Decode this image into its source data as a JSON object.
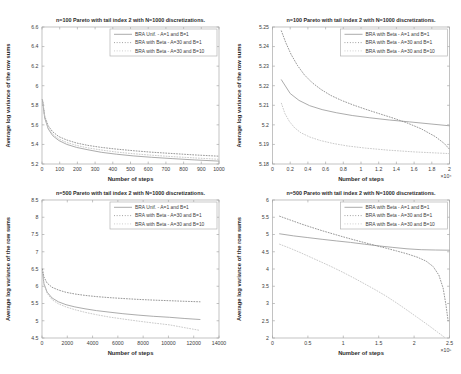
{
  "style": {
    "background": "#ffffff",
    "axis_color": "#a8a8a8",
    "text_color": "#3d3d3d",
    "title_color": "#2b2b2b",
    "legend_border_color": "#b4b4b4",
    "legend_background": "#ffffff"
  },
  "chart_data": [
    {
      "type": "line",
      "title": "n=100 Pareto with tail index 2 with N=1000 discretizations.",
      "xlabel": "Number of steps",
      "ylabel": "Average log variance of the row sums",
      "xlim": [
        0,
        1000
      ],
      "ylim": [
        5.2,
        6.6
      ],
      "xticks": [
        0,
        100,
        200,
        300,
        400,
        500,
        600,
        700,
        800,
        900,
        1000
      ],
      "xtick_labels": [
        "0",
        "100",
        "200",
        "300",
        "400",
        "500",
        "600",
        "700",
        "800",
        "900",
        "1000"
      ],
      "yticks": [
        5.2,
        5.4,
        5.6,
        5.8,
        6,
        6.2,
        6.4,
        6.6
      ],
      "ytick_labels": [
        "5.2",
        "5.4",
        "5.6",
        "5.8",
        "6",
        "6.2",
        "6.4",
        "6.6"
      ],
      "x_exponent_label": "",
      "legend_position": "top-right",
      "grid": false,
      "series": [
        {
          "name": "BRA Unif. - A=1 and B=1",
          "style": "solid",
          "color": "#a3a3a3",
          "x": [
            2,
            15,
            35,
            60,
            95,
            140,
            195,
            260,
            335,
            420,
            515,
            620,
            735,
            860,
            1000
          ],
          "y": [
            5.86,
            5.67,
            5.56,
            5.49,
            5.44,
            5.4,
            5.37,
            5.345,
            5.32,
            5.3,
            5.283,
            5.268,
            5.255,
            5.242,
            5.23
          ]
        },
        {
          "name": "BRA with Beta - A=30 and B=1",
          "style": "dotted",
          "color": "#8c8c8c",
          "x": [
            2,
            15,
            35,
            60,
            95,
            140,
            195,
            260,
            335,
            420,
            515,
            620,
            735,
            860,
            1000
          ],
          "y": [
            5.86,
            5.69,
            5.59,
            5.53,
            5.48,
            5.445,
            5.415,
            5.39,
            5.37,
            5.352,
            5.336,
            5.321,
            5.307,
            5.293,
            5.28
          ]
        },
        {
          "name": "BRA with Beta - A=30 and B=10",
          "style": "dotted",
          "color": "#c4c4c4",
          "x": [
            2,
            15,
            35,
            60,
            95,
            140,
            195,
            260,
            335,
            420,
            515,
            620,
            735,
            860,
            1000
          ],
          "y": [
            5.86,
            5.68,
            5.57,
            5.505,
            5.455,
            5.42,
            5.39,
            5.365,
            5.343,
            5.323,
            5.305,
            5.29,
            5.276,
            5.262,
            5.248
          ]
        }
      ]
    },
    {
      "type": "line",
      "title": "n=100 Pareto with tail index 2 with N=1000 discretizations.",
      "xlabel": "Number of steps",
      "ylabel": "Average log variance of the row sums",
      "xlim": [
        0,
        2
      ],
      "ylim": [
        5.18,
        5.25
      ],
      "xticks": [
        0,
        0.2,
        0.4,
        0.6,
        0.8,
        1,
        1.2,
        1.4,
        1.6,
        1.8,
        2
      ],
      "xtick_labels": [
        "0",
        "0.2",
        "0.4",
        "0.6",
        "0.8",
        "1",
        "1.2",
        "1.4",
        "1.6",
        "1.8",
        "2"
      ],
      "yticks": [
        5.18,
        5.19,
        5.2,
        5.21,
        5.22,
        5.23,
        5.24,
        5.25
      ],
      "ytick_labels": [
        "5.18",
        "5.19",
        "5.2",
        "5.21",
        "5.22",
        "5.23",
        "5.24",
        "5.25"
      ],
      "x_exponent_label": "×10⁴",
      "legend_position": "top-right",
      "grid": false,
      "series": [
        {
          "name": "BRA with Beta - A=1 and B=1",
          "style": "solid",
          "color": "#a3a3a3",
          "x": [
            0.1,
            0.2,
            0.3,
            0.42,
            0.56,
            0.72,
            0.9,
            1.1,
            1.32,
            1.55,
            1.78,
            2.0
          ],
          "y": [
            5.223,
            5.216,
            5.2125,
            5.2098,
            5.2078,
            5.2062,
            5.2048,
            5.2036,
            5.2025,
            5.2015,
            5.2005,
            5.1995
          ]
        },
        {
          "name": "BRA with Beta - A=30 and B=1",
          "style": "dotted",
          "color": "#8c8c8c",
          "x": [
            0.1,
            0.15,
            0.21,
            0.28,
            0.36,
            0.45,
            0.55,
            0.66,
            0.78,
            0.91,
            1.05,
            1.2,
            1.36,
            1.52,
            1.68,
            1.84,
            1.94,
            2.0
          ],
          "y": [
            5.248,
            5.242,
            5.236,
            5.2305,
            5.2255,
            5.2215,
            5.218,
            5.215,
            5.2125,
            5.2102,
            5.208,
            5.2058,
            5.2035,
            5.201,
            5.198,
            5.194,
            5.1905,
            5.1875
          ]
        },
        {
          "name": "BRA with Beta - A=30 and B=10",
          "style": "dotted",
          "color": "#c4c4c4",
          "x": [
            0.1,
            0.14,
            0.19,
            0.25,
            0.32,
            0.42,
            0.54,
            0.68,
            0.85,
            1.05,
            1.3,
            1.6,
            2.0
          ],
          "y": [
            5.211,
            5.2058,
            5.2018,
            5.1985,
            5.196,
            5.1938,
            5.192,
            5.1905,
            5.1892,
            5.1881,
            5.1871,
            5.1862,
            5.1853
          ]
        }
      ]
    },
    {
      "type": "line",
      "title": "n=500 Pareto with tail index 2 with N=1000 discretizations.",
      "xlabel": "Number of steps",
      "ylabel": "Average log variance of the row sums",
      "xlim": [
        0,
        14000
      ],
      "ylim": [
        4.5,
        8.5
      ],
      "xticks": [
        0,
        2000,
        4000,
        6000,
        8000,
        10000,
        12000,
        14000
      ],
      "xtick_labels": [
        "0",
        "2000",
        "4000",
        "6000",
        "8000",
        "10000",
        "12000",
        "14000"
      ],
      "yticks": [
        4.5,
        5,
        5.5,
        6,
        6.5,
        7,
        7.5,
        8,
        8.5
      ],
      "ytick_labels": [
        "4.5",
        "5",
        "5.5",
        "6",
        "6.5",
        "7",
        "7.5",
        "8",
        "8.5"
      ],
      "x_exponent_label": "",
      "legend_position": "top-right",
      "grid": false,
      "series": [
        {
          "name": "BRA Unif. - A=1 and B=1",
          "style": "solid",
          "color": "#a3a3a3",
          "x": [
            30,
            150,
            400,
            800,
            1300,
            1900,
            2600,
            3400,
            4300,
            5300,
            6400,
            7600,
            8800,
            10100,
            11300,
            12500
          ],
          "y": [
            6.45,
            6.08,
            5.83,
            5.66,
            5.55,
            5.465,
            5.4,
            5.345,
            5.295,
            5.25,
            5.205,
            5.165,
            5.13,
            5.1,
            5.065,
            5.035
          ]
        },
        {
          "name": "BRA with Beta - A=30 and B=1",
          "style": "dotted",
          "color": "#8c8c8c",
          "x": [
            30,
            150,
            400,
            800,
            1300,
            1900,
            2600,
            3400,
            4300,
            5300,
            6400,
            7600,
            8800,
            10100,
            11300,
            12500
          ],
          "y": [
            6.5,
            6.27,
            6.09,
            5.97,
            5.89,
            5.825,
            5.775,
            5.735,
            5.7,
            5.67,
            5.645,
            5.62,
            5.6,
            5.58,
            5.565,
            5.55
          ]
        },
        {
          "name": "BRA with Beta - A=30 and B=10",
          "style": "dotted",
          "color": "#c4c4c4",
          "x": [
            30,
            150,
            400,
            800,
            1300,
            1900,
            2600,
            3400,
            4300,
            5300,
            6400,
            7600,
            8800,
            10100,
            11300,
            12500
          ],
          "y": [
            6.45,
            6.06,
            5.8,
            5.61,
            5.49,
            5.4,
            5.32,
            5.245,
            5.175,
            5.11,
            5.05,
            4.99,
            4.935,
            4.88,
            4.8,
            4.72
          ]
        }
      ]
    },
    {
      "type": "line",
      "title": "n=500 Pareto with tail index 2 with N=1000 discretizations.",
      "xlabel": "Number of steps",
      "ylabel": "Average log variance of the row sums",
      "xlim": [
        0,
        2.5
      ],
      "ylim": [
        2,
        6
      ],
      "xticks": [
        0,
        0.5,
        1,
        1.5,
        2,
        2.5
      ],
      "xtick_labels": [
        "0",
        "0.5",
        "1",
        "1.5",
        "2",
        "2.5"
      ],
      "yticks": [
        2,
        2.5,
        3,
        3.5,
        4,
        4.5,
        5,
        5.5,
        6
      ],
      "ytick_labels": [
        "2",
        "2.5",
        "3",
        "3.5",
        "4",
        "4.5",
        "5",
        "5.5",
        "6"
      ],
      "x_exponent_label": "×10⁵",
      "legend_position": "top-right",
      "grid": false,
      "series": [
        {
          "name": "BRA with Beta - A=1 and B=1",
          "style": "solid",
          "color": "#a3a3a3",
          "x": [
            0.1,
            0.3,
            0.5,
            0.7,
            0.9,
            1.1,
            1.3,
            1.5,
            1.7,
            1.9,
            2.1,
            2.3,
            2.5
          ],
          "y": [
            5.02,
            4.96,
            4.91,
            4.86,
            4.815,
            4.77,
            4.72,
            4.67,
            4.625,
            4.585,
            4.56,
            4.55,
            4.545
          ]
        },
        {
          "name": "BRA with Beta - A=30 and B=1",
          "style": "dotted",
          "color": "#8c8c8c",
          "x": [
            0.1,
            0.25,
            0.4,
            0.55,
            0.7,
            0.85,
            1.0,
            1.15,
            1.3,
            1.45,
            1.6,
            1.75,
            1.9,
            2.05,
            2.17,
            2.27,
            2.35,
            2.41,
            2.45,
            2.48
          ],
          "y": [
            5.53,
            5.42,
            5.31,
            5.21,
            5.11,
            5.02,
            4.93,
            4.845,
            4.765,
            4.685,
            4.605,
            4.525,
            4.44,
            4.34,
            4.23,
            4.07,
            3.82,
            3.45,
            2.95,
            2.5
          ]
        },
        {
          "name": "BRA with Beta - A=30 and B=10",
          "style": "dotted",
          "color": "#c4c4c4",
          "x": [
            0.1,
            0.25,
            0.4,
            0.55,
            0.7,
            0.85,
            1.0,
            1.15,
            1.3,
            1.45,
            1.6,
            1.75,
            1.9,
            2.05,
            2.2,
            2.33,
            2.43
          ],
          "y": [
            4.72,
            4.6,
            4.47,
            4.33,
            4.19,
            4.05,
            3.9,
            3.74,
            3.57,
            3.4,
            3.22,
            3.02,
            2.81,
            2.59,
            2.37,
            2.17,
            2.02
          ]
        }
      ]
    }
  ]
}
